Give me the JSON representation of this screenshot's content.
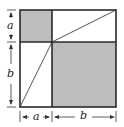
{
  "diagram": {
    "labels": {
      "left_top": "a",
      "left_bottom": "b",
      "bottom_left": "a",
      "bottom_right": "b"
    },
    "colors": {
      "shade": "#bdbdbd",
      "line": "#2a2a2a",
      "background": "#ffffff"
    },
    "geometry": {
      "outer_square": {
        "x": 20,
        "y": 10,
        "size": 96
      },
      "divider_x": 52,
      "divider_y": 42
    }
  }
}
